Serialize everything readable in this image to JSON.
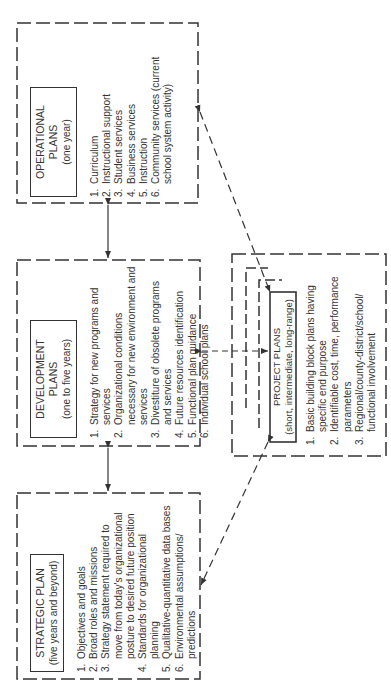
{
  "diagram": {
    "orientation": "rotated-90-ccw",
    "strategic": {
      "title": "STRATEGIC PLAN",
      "subtitle": "(five years and beyond)",
      "items": [
        {
          "num": "1.",
          "text": "Objectives and goals"
        },
        {
          "num": "2.",
          "text": "Broad roles and missions"
        },
        {
          "num": "3.",
          "text": "Strategy statement required to move from today's organizational posture to desired future position"
        },
        {
          "num": "4.",
          "text": "Standards for organizational planning"
        },
        {
          "num": "5.",
          "text": "Qualitative-quantitative data bases"
        },
        {
          "num": "6.",
          "text": "Environmental assumptions/ predictions"
        }
      ]
    },
    "development": {
      "title": "DEVELOPMENT PLANS",
      "subtitle": "(one to five years)",
      "items": [
        {
          "num": "1.",
          "text": "Strategy for new programs and services"
        },
        {
          "num": "2.",
          "text": "Organizational conditions necessary for new environment and services"
        },
        {
          "num": "3.",
          "text": "Divestiture of obsolete programs and services"
        },
        {
          "num": "4.",
          "text": "Future resources identification"
        },
        {
          "num": "5.",
          "text": "Functional plan guidance"
        },
        {
          "num": "6.",
          "text": "Individual school plans"
        }
      ]
    },
    "operational": {
      "title": "OPERATIONAL PLANS",
      "subtitle": "(one year)",
      "items": [
        {
          "num": "1.",
          "text": "Curriculum"
        },
        {
          "num": "2.",
          "text": "Instructional support"
        },
        {
          "num": "3.",
          "text": "Student services"
        },
        {
          "num": "4.",
          "text": "Business services"
        },
        {
          "num": "5.",
          "text": "Instruction"
        },
        {
          "num": "6.",
          "text": "Community services (current school system activity)"
        }
      ]
    },
    "project": {
      "title": "PROJECT PLANS",
      "subtitle": "(short, intermediate, long-range)",
      "items": [
        {
          "num": "1.",
          "text": "Basic building block plans having specific end purpose"
        },
        {
          "num": "2.",
          "text": "Identifiable cost, time, performance parameters"
        },
        {
          "num": "3.",
          "text": "Regional/county-district/school/ functional involvement"
        }
      ]
    },
    "connections": [
      {
        "from": "strategic",
        "to": "development",
        "style": "solid",
        "arrows": "both"
      },
      {
        "from": "development",
        "to": "operational",
        "style": "solid",
        "arrows": "both"
      },
      {
        "from": "development",
        "to": "project",
        "style": "dashed",
        "arrows": "both"
      },
      {
        "from": "strategic",
        "to": "project",
        "style": "dashed",
        "arrows": "to-strategic"
      },
      {
        "from": "operational",
        "to": "project",
        "style": "dashed",
        "arrows": "both"
      }
    ],
    "colors": {
      "line": "#333333",
      "background": "#ffffff"
    }
  }
}
